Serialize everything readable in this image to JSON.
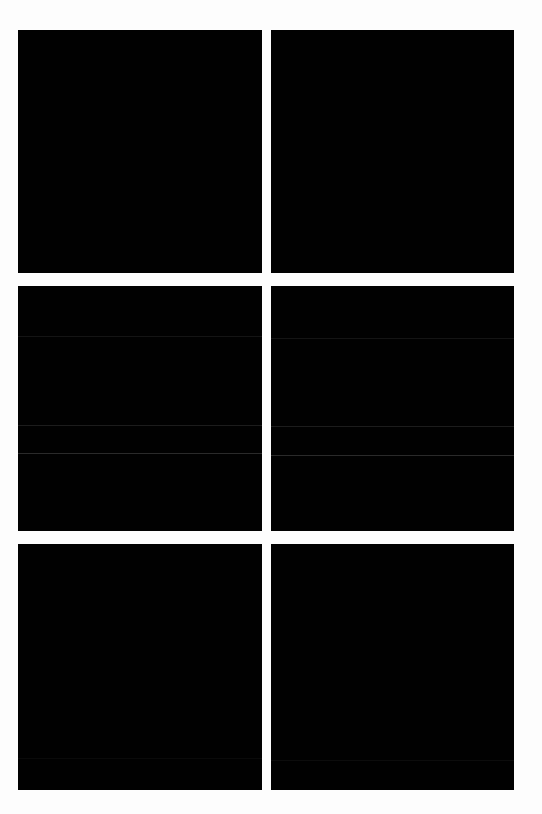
{
  "page": {
    "background_color": "#fdfdfd"
  },
  "gallery": {
    "tile_color": "#010101",
    "tiles": [
      {
        "label": "",
        "row": 1,
        "column": 1,
        "lines": []
      },
      {
        "label": "",
        "row": 1,
        "column": 2,
        "lines": []
      },
      {
        "label": "",
        "row": 2,
        "column": 1,
        "lines": [
          {
            "offset_px": 50,
            "color": "#141414"
          },
          {
            "offset_px": 139,
            "color": "#1c1c1c"
          },
          {
            "offset_px": 167,
            "color": "#2a2a2a"
          }
        ]
      },
      {
        "label": "",
        "row": 2,
        "column": 2,
        "lines": [
          {
            "offset_px": 52,
            "color": "#141414"
          },
          {
            "offset_px": 140,
            "color": "#1c1c1c"
          },
          {
            "offset_px": 169,
            "color": "#2a2a2a"
          }
        ]
      },
      {
        "label": "",
        "row": 3,
        "column": 1,
        "lines": [
          {
            "offset_px": 214,
            "color": "#0a0a0a"
          }
        ]
      },
      {
        "label": "",
        "row": 3,
        "column": 2,
        "lines": [
          {
            "offset_px": 216,
            "color": "#0c0c0c"
          }
        ]
      }
    ]
  }
}
